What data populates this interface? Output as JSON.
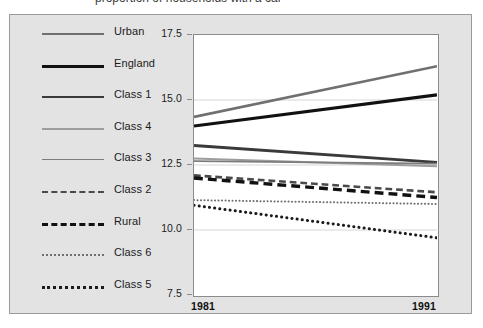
{
  "figure": {
    "background_color": "#e3e3e3",
    "border_color": "#9a9a9a",
    "plot_background": "#ffffff"
  },
  "clipped_caption": "proportion of households with a car",
  "legend": {
    "position": "left",
    "items": [
      {
        "label": "Urban",
        "color": "#707070",
        "width": 2.6,
        "style": "solid"
      },
      {
        "label": "England",
        "color": "#111111",
        "width": 3.2,
        "style": "solid"
      },
      {
        "label": "Class 1",
        "color": "#3a3a3a",
        "width": 2.8,
        "style": "solid"
      },
      {
        "label": "Class 4",
        "color": "#9d9d9d",
        "width": 2.0,
        "style": "solid"
      },
      {
        "label": "Class 3",
        "color": "#7c7c7c",
        "width": 1.8,
        "style": "solid"
      },
      {
        "label": "Class 2",
        "color": "#4a4a4a",
        "width": 2.6,
        "style": "dashed"
      },
      {
        "label": "Rural",
        "color": "#111111",
        "width": 3.4,
        "style": "dashed"
      },
      {
        "label": "Class 6",
        "color": "#6f6f6f",
        "width": 2.0,
        "style": "dotted"
      },
      {
        "label": "Class 5",
        "color": "#1b1b1b",
        "width": 3.0,
        "style": "dotted"
      }
    ]
  },
  "axes": {
    "y_ticks": [
      "7.5",
      "10.0",
      "12.5",
      "15.0",
      "17.5"
    ],
    "y_values": [
      7.5,
      10.0,
      12.5,
      15.0,
      17.5
    ],
    "x_ticks": [
      "1981",
      "1991"
    ],
    "x_values": [
      1981,
      1991
    ],
    "xlim": [
      1981,
      1991
    ],
    "ylim": [
      7.5,
      17.5
    ]
  },
  "chart_data": {
    "type": "line",
    "title": "",
    "xlabel": "",
    "ylabel": "",
    "x": [
      1981,
      1991
    ],
    "xlim": [
      1981,
      1991
    ],
    "ylim": [
      7.5,
      17.5
    ],
    "grid": true,
    "legend_position": "left",
    "series": [
      {
        "name": "Urban",
        "values": [
          14.35,
          16.3
        ],
        "color": "#707070",
        "style": "solid",
        "width": 2.6
      },
      {
        "name": "England",
        "values": [
          14.0,
          15.2
        ],
        "color": "#111111",
        "style": "solid",
        "width": 3.2
      },
      {
        "name": "Class 1",
        "values": [
          13.25,
          12.6
        ],
        "color": "#3a3a3a",
        "style": "solid",
        "width": 2.8
      },
      {
        "name": "Class 4",
        "values": [
          12.75,
          12.45
        ],
        "color": "#9d9d9d",
        "style": "solid",
        "width": 2.0
      },
      {
        "name": "Class 3",
        "values": [
          12.65,
          12.55
        ],
        "color": "#7c7c7c",
        "style": "solid",
        "width": 1.8
      },
      {
        "name": "Class 2",
        "values": [
          12.1,
          11.45
        ],
        "color": "#4a4a4a",
        "style": "dashed",
        "width": 2.6
      },
      {
        "name": "Rural",
        "values": [
          12.0,
          11.25
        ],
        "color": "#111111",
        "style": "dashed",
        "width": 3.4
      },
      {
        "name": "Class 6",
        "values": [
          11.15,
          11.0
        ],
        "color": "#6f6f6f",
        "style": "dotted",
        "width": 2.0
      },
      {
        "name": "Class 5",
        "values": [
          10.95,
          9.7
        ],
        "color": "#1b1b1b",
        "style": "dotted",
        "width": 3.0
      }
    ]
  }
}
